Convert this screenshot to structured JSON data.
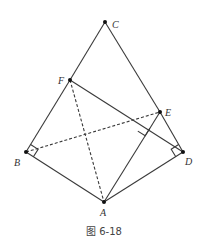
{
  "figure": {
    "caption": "图 6-18",
    "stroke_color": "#3a3a3a",
    "points": {
      "A": {
        "label": "A",
        "x": 104,
        "y": 202
      },
      "B": {
        "label": "B",
        "x": 26,
        "y": 152
      },
      "C": {
        "label": "C",
        "x": 105,
        "y": 22
      },
      "D": {
        "label": "D",
        "x": 183,
        "y": 152
      },
      "E": {
        "label": "E",
        "x": 160,
        "y": 112
      },
      "F": {
        "label": "F",
        "x": 70,
        "y": 80
      }
    },
    "solid_segments": [
      "CF",
      "FB",
      "CE",
      "ED",
      "BA",
      "AD",
      "FD",
      "AE"
    ],
    "dashed_segments": [
      "FA",
      "BE"
    ],
    "right_angles": [
      "at B (∠FBA... between BF and BA)",
      "at D (between DE and DA)",
      "at foot of AE on FD"
    ]
  }
}
